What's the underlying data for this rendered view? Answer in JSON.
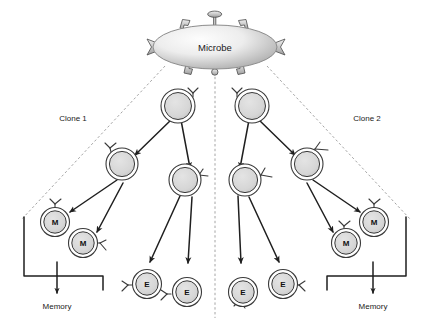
{
  "diagram": {
    "title_text": "Microbe",
    "type": "clonal-selection",
    "background": "#ffffff",
    "stroke_color": "#2b2b2b",
    "cell_fill": "#d9d9d9",
    "cell_rim_fill": "#ffffff",
    "microbe_fill_light": "#f2f2f2",
    "microbe_fill_dark": "#b5b5b5",
    "dashed_color": "#9a9a9a"
  },
  "labels": {
    "microbe": "Microbe",
    "clone_left": "Clone 1",
    "clone_right": "Clone 2",
    "memory_left": "Memory",
    "memory_right": "Memory"
  },
  "cells": {
    "left": {
      "progenitor": {
        "char": ""
      },
      "tier2_a": {
        "char": ""
      },
      "tier2_b": {
        "char": ""
      },
      "memory_1": {
        "char": "M"
      },
      "memory_2": {
        "char": "M"
      },
      "effector_1": {
        "char": "E"
      },
      "effector_2": {
        "char": "E"
      }
    },
    "right": {
      "progenitor": {
        "char": ""
      },
      "tier2_a": {
        "char": ""
      },
      "tier2_b": {
        "char": ""
      },
      "memory_1": {
        "char": "M"
      },
      "memory_2": {
        "char": "M"
      },
      "effector_1": {
        "char": "E"
      },
      "effector_2": {
        "char": "E"
      }
    }
  }
}
